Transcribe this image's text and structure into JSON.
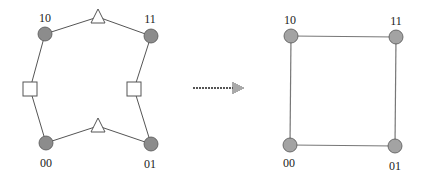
{
  "colors": {
    "edge": "#555555",
    "edge_right": "#777777",
    "node_left": "#8c8c8c",
    "node_right": "#a3a3a3",
    "node_stroke": "#555555",
    "shape_fill": "#ffffff",
    "shape_stroke": "#555555",
    "arrow": "#555555"
  },
  "left_graph": {
    "nodes": [
      {
        "id": "10",
        "label": "10",
        "x": 45,
        "y": 34,
        "lx": 45,
        "ly": 22
      },
      {
        "id": "11",
        "label": "11",
        "x": 151,
        "y": 36,
        "lx": 150,
        "ly": 23
      },
      {
        "id": "00",
        "label": "00",
        "x": 46,
        "y": 143,
        "lx": 46,
        "ly": 167
      },
      {
        "id": "01",
        "label": "01",
        "x": 151,
        "y": 144,
        "lx": 150,
        "ly": 168
      }
    ],
    "intermediate": [
      {
        "type": "triangle",
        "between": [
          "10",
          "11"
        ],
        "x": 98,
        "y": 17
      },
      {
        "type": "square",
        "between": [
          "10",
          "00"
        ],
        "x": 30,
        "y": 89
      },
      {
        "type": "square",
        "between": [
          "11",
          "01"
        ],
        "x": 134,
        "y": 89
      },
      {
        "type": "triangle",
        "between": [
          "00",
          "01"
        ],
        "x": 98,
        "y": 126
      }
    ]
  },
  "arrow": {
    "x1": 193,
    "x2": 245,
    "y": 88,
    "style": "dotted"
  },
  "right_graph": {
    "nodes": [
      {
        "id": "10",
        "label": "10",
        "x": 291,
        "y": 36,
        "lx": 290,
        "ly": 24
      },
      {
        "id": "11",
        "label": "11",
        "x": 396,
        "y": 37,
        "lx": 396,
        "ly": 25
      },
      {
        "id": "00",
        "label": "00",
        "x": 290,
        "y": 145,
        "lx": 289,
        "ly": 167
      },
      {
        "id": "01",
        "label": "01",
        "x": 395,
        "y": 146,
        "lx": 395,
        "ly": 170
      }
    ],
    "edges": [
      [
        "10",
        "11"
      ],
      [
        "11",
        "01"
      ],
      [
        "01",
        "00"
      ],
      [
        "00",
        "10"
      ]
    ]
  }
}
